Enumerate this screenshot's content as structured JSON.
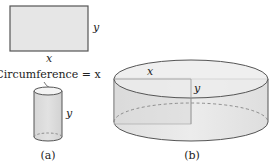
{
  "figure": {
    "panel_a": {
      "label": "(a)",
      "rectangle": {
        "width_label": "x",
        "height_label": "y"
      },
      "cylinder": {
        "circumference_label": "Circumference = x",
        "height_label": "y"
      }
    },
    "panel_b": {
      "label": "(b)",
      "rectangle": {
        "width_label": "x",
        "height_label": "y"
      }
    }
  },
  "colors": {
    "fill_gray": "#e4e4e4",
    "fill_light": "#efefef",
    "stroke": "#555555",
    "text": "#222222"
  }
}
